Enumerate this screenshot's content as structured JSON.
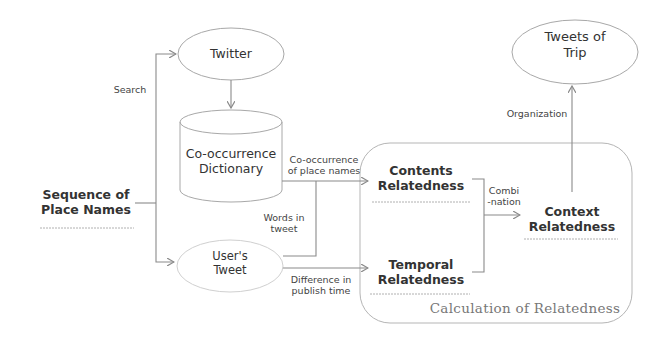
{
  "diagram": {
    "nodes": {
      "sequence": {
        "label": "Sequence of\nPlace Names",
        "shape": "box"
      },
      "twitter": {
        "label": "Twitter",
        "shape": "ellipse"
      },
      "dictionary": {
        "label": "Co-occurrence\nDictionary",
        "shape": "cylinder"
      },
      "users_tweet": {
        "label": "User's\nTweet",
        "shape": "ellipse"
      },
      "contents": {
        "label": "Contents\nRelatedness",
        "shape": "box"
      },
      "temporal": {
        "label": "Temporal\nRelatedness",
        "shape": "box"
      },
      "context": {
        "label": "Context\nRelatedness",
        "shape": "box"
      },
      "tweets_of_trip": {
        "label": "Tweets of\nTrip",
        "shape": "ellipse"
      }
    },
    "group": {
      "label": "Calculation of Relatedness"
    },
    "edges": {
      "search": "Search",
      "cooccurrence": "Co-occurrence\nof place names",
      "words": "Words in\ntweet",
      "difference": "Difference in\npublish time",
      "combination": "Combi\n-nation",
      "organization": "Organization"
    },
    "colors": {
      "line": "#8a8a8a",
      "text": "#333333",
      "group_title": "#777777"
    }
  }
}
